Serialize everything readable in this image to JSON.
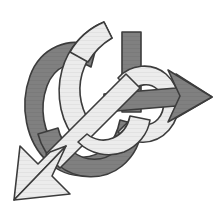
{
  "figure": {
    "name": "interlocked-ribbon-arrows-knot",
    "width": 218,
    "height": 218,
    "background_color": "#ffffff"
  },
  "palette": {
    "background": "#ffffff",
    "dark_band_fill": "#808080",
    "dark_band_shade": "#767676",
    "light_band_fill": "#ececec",
    "light_band_shade": "#dcdcdc",
    "outline": "#3c3c3c",
    "outline_soft": "#555555"
  },
  "elements": {
    "dark_ribbon": {
      "label": "dark-gray-ribbon-arrow",
      "fill": "#808080",
      "outline": "#3c3c3c",
      "stroke_width": 1.6,
      "arrowhead_direction": "right",
      "arrow_tip": [
        212,
        97
      ],
      "ribbon_width": 22
    },
    "light_ribbon": {
      "label": "light-gray-ribbon-arrow",
      "fill": "#ececec",
      "outline": "#3c3c3c",
      "stroke_width": 1.6,
      "arrowhead_direction": "down-left",
      "arrow_tip": [
        14,
        200
      ],
      "ribbon_width": 20
    },
    "crossings": [
      {
        "id": "crossing-top-left",
        "over": "light_ribbon",
        "under": "dark_ribbon",
        "at": [
          74,
          56
        ]
      },
      {
        "id": "crossing-top-right",
        "over": "dark_ribbon",
        "under": "light_ribbon",
        "at": [
          120,
          62
        ]
      },
      {
        "id": "crossing-center",
        "over": "light_ribbon",
        "under": "dark_ribbon",
        "at": [
          108,
          104
        ]
      },
      {
        "id": "crossing-right-ring",
        "over": "dark_ribbon",
        "under": "light_ribbon",
        "at": [
          148,
          112
        ]
      },
      {
        "id": "crossing-lower-left",
        "over": "dark_ribbon",
        "under": "light_ribbon",
        "at": [
          62,
          152
        ]
      },
      {
        "id": "crossing-lower-center",
        "over": "dark_ribbon",
        "under": "light_ribbon",
        "at": [
          118,
          146
        ]
      }
    ]
  }
}
